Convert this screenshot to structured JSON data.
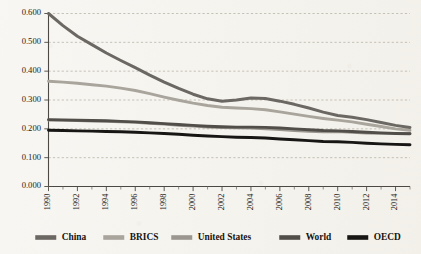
{
  "chart_data": {
    "type": "line",
    "title": "",
    "subtitle": "",
    "xlabel": "",
    "ylabel": "",
    "xlim": [
      1990,
      2015
    ],
    "ylim": [
      0.0,
      0.6
    ],
    "grid": true,
    "grid_style": "dashed-horizontal",
    "legend_position": "bottom",
    "y_ticks": [
      "0.000",
      "0.100",
      "0.200",
      "0.300",
      "0.400",
      "0.500",
      "0.600"
    ],
    "y_tick_values": [
      0.0,
      0.1,
      0.2,
      0.3,
      0.4,
      0.5,
      0.6
    ],
    "x_ticks": [
      "1990",
      "1992",
      "1994",
      "1996",
      "1998",
      "2000",
      "2002",
      "2004",
      "2006",
      "2008",
      "2010",
      "2012",
      "2014"
    ],
    "x_tick_values": [
      1990,
      1992,
      1994,
      1996,
      1998,
      2000,
      2002,
      2004,
      2006,
      2008,
      2010,
      2012,
      2014
    ],
    "x": [
      1990,
      1991,
      1992,
      1993,
      1994,
      1995,
      1996,
      1997,
      1998,
      1999,
      2000,
      2001,
      2002,
      2003,
      2004,
      2005,
      2006,
      2007,
      2008,
      2009,
      2010,
      2011,
      2012,
      2013,
      2014,
      2015
    ],
    "series": [
      {
        "name": "China",
        "color": "#6b6762",
        "values": [
          0.6,
          0.558,
          0.521,
          0.492,
          0.463,
          0.437,
          0.412,
          0.386,
          0.362,
          0.34,
          0.32,
          0.304,
          0.296,
          0.3,
          0.307,
          0.305,
          0.296,
          0.285,
          0.272,
          0.258,
          0.246,
          0.24,
          0.232,
          0.222,
          0.212,
          0.205
        ]
      },
      {
        "name": "BRICS",
        "color": "#a9a59d",
        "values": [
          0.365,
          0.362,
          0.358,
          0.353,
          0.348,
          0.341,
          0.333,
          0.322,
          0.31,
          0.299,
          0.289,
          0.281,
          0.275,
          0.272,
          0.27,
          0.266,
          0.259,
          0.251,
          0.243,
          0.236,
          0.23,
          0.224,
          0.216,
          0.208,
          0.2,
          0.195
        ]
      },
      {
        "name": "United States",
        "color": "#9b9790",
        "values": [
          0.23,
          0.229,
          0.228,
          0.227,
          0.226,
          0.224,
          0.222,
          0.219,
          0.216,
          0.212,
          0.209,
          0.206,
          0.204,
          0.203,
          0.202,
          0.2,
          0.197,
          0.194,
          0.191,
          0.189,
          0.19,
          0.188,
          0.185,
          0.184,
          0.184,
          0.184
        ]
      },
      {
        "name": "World",
        "color": "#514e4a",
        "values": [
          0.232,
          0.231,
          0.23,
          0.229,
          0.228,
          0.226,
          0.224,
          0.221,
          0.218,
          0.215,
          0.212,
          0.209,
          0.207,
          0.206,
          0.206,
          0.205,
          0.203,
          0.2,
          0.197,
          0.194,
          0.193,
          0.191,
          0.188,
          0.186,
          0.184,
          0.183
        ]
      },
      {
        "name": "OECD",
        "color": "#181614",
        "values": [
          0.195,
          0.194,
          0.193,
          0.192,
          0.191,
          0.19,
          0.188,
          0.186,
          0.184,
          0.181,
          0.178,
          0.175,
          0.173,
          0.171,
          0.17,
          0.168,
          0.165,
          0.162,
          0.159,
          0.156,
          0.155,
          0.153,
          0.15,
          0.148,
          0.146,
          0.145
        ]
      }
    ],
    "legend": [
      {
        "label": "China",
        "color": "#6b6762"
      },
      {
        "label": "BRICS",
        "color": "#a9a59d"
      },
      {
        "label": "United States",
        "color": "#9b9790"
      },
      {
        "label": "World",
        "color": "#514e4a"
      },
      {
        "label": "OECD",
        "color": "#181614"
      }
    ]
  }
}
